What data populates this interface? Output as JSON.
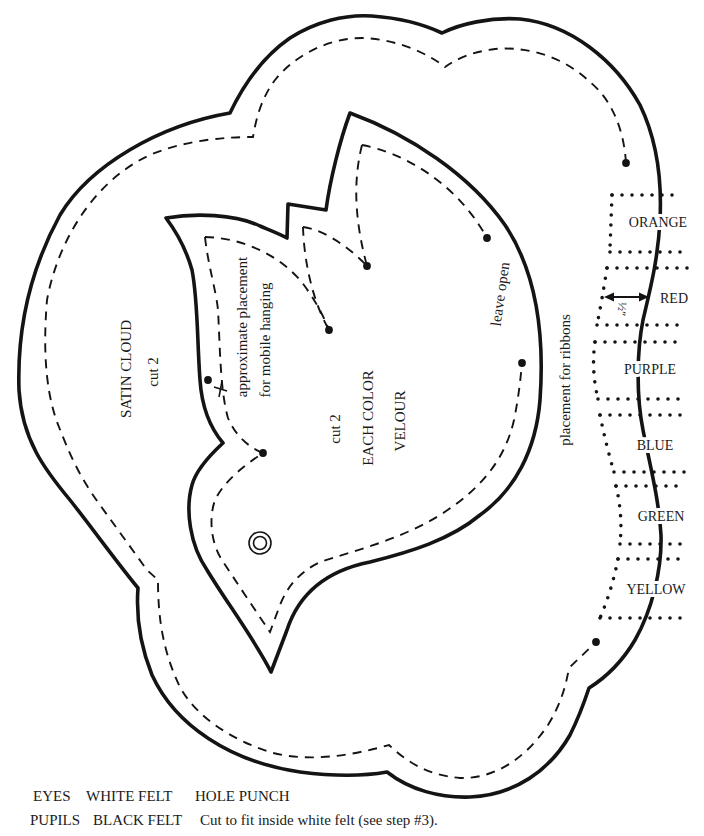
{
  "cloud": {
    "name": "SATIN CLOUD",
    "cut": "cut 2"
  },
  "bird": {
    "cut": "cut 2",
    "line1": "EACH COLOR",
    "line2": "VELOUR",
    "hanging_note": [
      "approximate placement",
      "for mobile hanging"
    ],
    "leave_open": "leave open"
  },
  "ribbons": {
    "placement_label": "placement for ribbons",
    "width_label": "½″",
    "colors": [
      {
        "label": "ORANGE"
      },
      {
        "label": "RED"
      },
      {
        "label": "PURPLE"
      },
      {
        "label": "BLUE"
      },
      {
        "label": "GREEN"
      },
      {
        "label": "YELLOW"
      }
    ]
  },
  "materials": [
    {
      "part": "EYES",
      "material": "WHITE FELT",
      "instruction": "HOLE PUNCH"
    },
    {
      "part": "PUPILS",
      "material": "BLACK FELT",
      "instruction": "Cut to fit inside white felt (see step #3)."
    }
  ],
  "colors": {
    "ink": "#141414",
    "paper": "#ffffff"
  }
}
